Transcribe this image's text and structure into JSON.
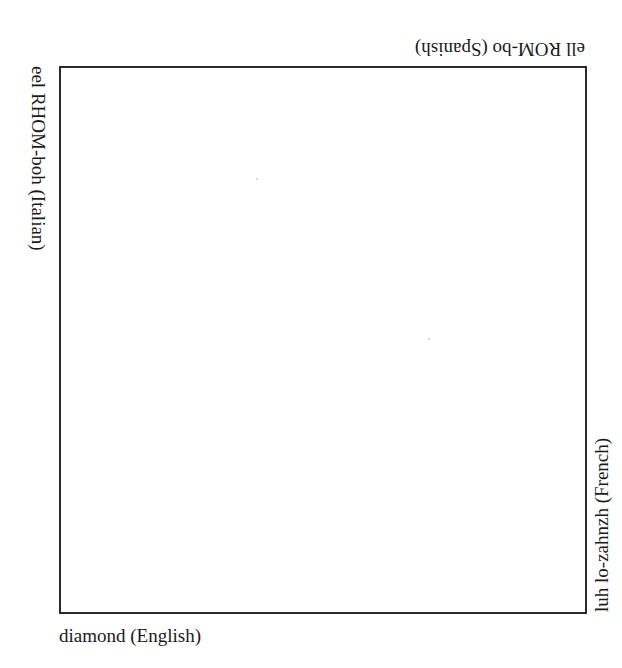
{
  "diagram": {
    "type": "square-frame-with-rotated-edge-labels",
    "frame_color": "#2a2a2a",
    "labels": {
      "bottom": "diamond (English)",
      "top": "ell ROM-bo (Spanish)",
      "left": "eel RHOM-boh (Italian)",
      "right": "luh lo-zahnzh (French)"
    }
  }
}
